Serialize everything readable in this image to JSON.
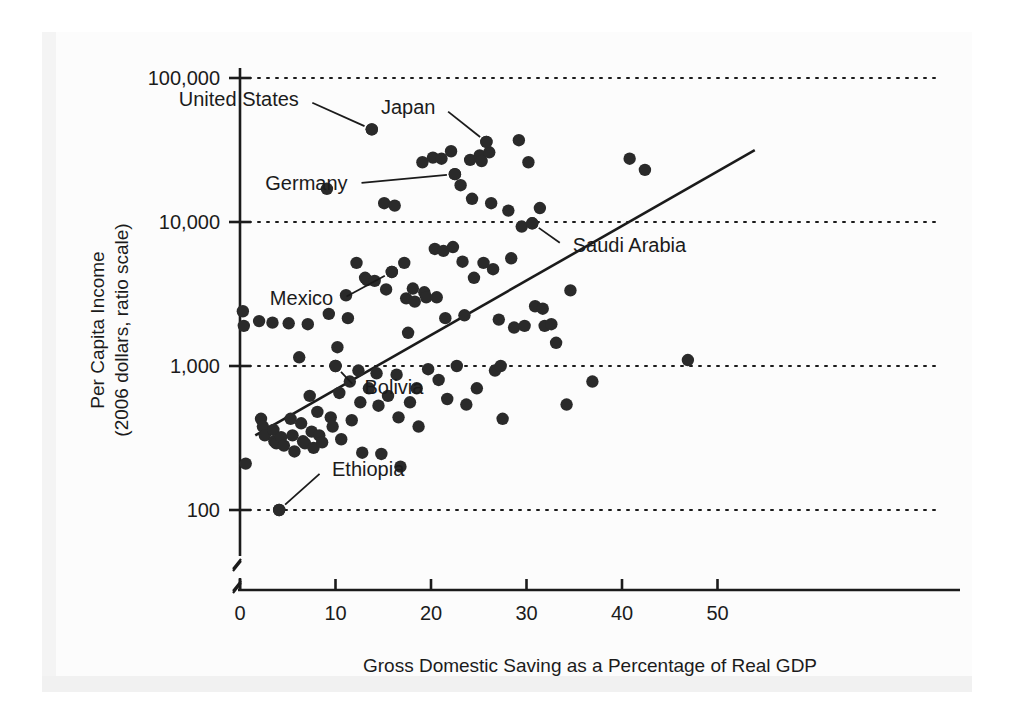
{
  "chart_data": {
    "type": "scatter",
    "title": "",
    "xlabel": "Gross Domestic Saving as a Percentage of Real GDP",
    "ylabel": "Per Capita Income\n(2006 dollars, ratio scale)",
    "ylabel_line1": "Per Capita Income",
    "ylabel_line2": "(2006 dollars, ratio scale)",
    "xlim": [
      0,
      52
    ],
    "ylim": [
      85,
      110000
    ],
    "yscale": "log",
    "xticks": [
      0,
      10,
      20,
      30,
      40,
      50
    ],
    "xticklabels": [
      "0",
      "10",
      "20",
      "30",
      "40",
      "50"
    ],
    "yticks": [
      100,
      1000,
      10000,
      100000
    ],
    "yticklabels": [
      "100",
      "1,000",
      "10,000",
      "100,000"
    ],
    "grid": "horizontal dotted gridlines at each y tick",
    "legend": "none",
    "axis_break": "both axes broken near origin",
    "marker_color": "#2a2a2a",
    "line_color": "#1b1b1b",
    "trendline": {
      "label": "regression line",
      "x_start": 1.6,
      "y_start": 330,
      "x_end": 53.9,
      "y_end": 31500
    },
    "annotations": [
      {
        "label": "United States",
        "x": 13.8,
        "y": 44000,
        "label_x": 7.0,
        "label_y": 70000
      },
      {
        "label": "Japan",
        "x": 25.8,
        "y": 36000,
        "label_x": 21.3,
        "label_y": 62000
      },
      {
        "label": "Germany",
        "x": 22.5,
        "y": 21500,
        "label_x": 12.1,
        "label_y": 18500
      },
      {
        "label": "Saudi Arabia",
        "x": 30.6,
        "y": 9800,
        "label_x": 34.0,
        "label_y": 6800
      },
      {
        "label": "Mexico",
        "x": 15.9,
        "y": 4500,
        "label_x": 10.6,
        "label_y": 2900
      },
      {
        "label": "Bolivia",
        "x": 10.0,
        "y": 1000,
        "label_x": 12.2,
        "label_y": 700
      },
      {
        "label": "Ethiopia",
        "x": 4.1,
        "y": 100,
        "label_x": 8.8,
        "label_y": 190
      }
    ],
    "points": [
      [
        0.3,
        2400
      ],
      [
        0.4,
        1900
      ],
      [
        0.6,
        210
      ],
      [
        2.0,
        2050
      ],
      [
        2.2,
        430
      ],
      [
        2.4,
        380
      ],
      [
        2.6,
        330
      ],
      [
        3.4,
        2000
      ],
      [
        3.5,
        360
      ],
      [
        3.6,
        300
      ],
      [
        3.8,
        290
      ],
      [
        4.1,
        100
      ],
      [
        4.3,
        320
      ],
      [
        4.6,
        280
      ],
      [
        5.1,
        1980
      ],
      [
        5.3,
        430
      ],
      [
        5.5,
        330
      ],
      [
        5.7,
        255
      ],
      [
        6.2,
        1150
      ],
      [
        6.4,
        400
      ],
      [
        6.6,
        300
      ],
      [
        6.8,
        290
      ],
      [
        7.1,
        1950
      ],
      [
        7.3,
        620
      ],
      [
        7.5,
        350
      ],
      [
        7.7,
        270
      ],
      [
        8.1,
        480
      ],
      [
        8.3,
        330
      ],
      [
        8.6,
        295
      ],
      [
        9.1,
        17000
      ],
      [
        9.3,
        2300
      ],
      [
        9.5,
        440
      ],
      [
        9.7,
        380
      ],
      [
        10.0,
        1000
      ],
      [
        10.2,
        1350
      ],
      [
        10.4,
        650
      ],
      [
        10.6,
        310
      ],
      [
        11.1,
        3100
      ],
      [
        11.3,
        2150
      ],
      [
        11.5,
        780
      ],
      [
        11.7,
        420
      ],
      [
        12.2,
        5200
      ],
      [
        12.4,
        930
      ],
      [
        12.6,
        560
      ],
      [
        12.8,
        250
      ],
      [
        13.1,
        4100
      ],
      [
        13.3,
        3950
      ],
      [
        13.5,
        700
      ],
      [
        13.8,
        44000
      ],
      [
        14.1,
        3900
      ],
      [
        14.3,
        890
      ],
      [
        14.5,
        530
      ],
      [
        14.8,
        245
      ],
      [
        15.1,
        13500
      ],
      [
        15.3,
        3400
      ],
      [
        15.5,
        620
      ],
      [
        15.9,
        4500
      ],
      [
        16.2,
        13000
      ],
      [
        16.4,
        870
      ],
      [
        16.6,
        440
      ],
      [
        16.8,
        200
      ],
      [
        17.2,
        5200
      ],
      [
        17.4,
        2950
      ],
      [
        17.6,
        1700
      ],
      [
        17.8,
        560
      ],
      [
        18.1,
        3450
      ],
      [
        18.3,
        2800
      ],
      [
        18.5,
        700
      ],
      [
        18.7,
        380
      ],
      [
        19.1,
        26000
      ],
      [
        19.3,
        3250
      ],
      [
        19.5,
        3000
      ],
      [
        19.7,
        950
      ],
      [
        20.2,
        28000
      ],
      [
        20.4,
        6500
      ],
      [
        20.6,
        3000
      ],
      [
        20.8,
        800
      ],
      [
        21.1,
        27500
      ],
      [
        21.3,
        6300
      ],
      [
        21.5,
        2150
      ],
      [
        21.7,
        590
      ],
      [
        22.1,
        31000
      ],
      [
        22.3,
        6700
      ],
      [
        22.5,
        21500
      ],
      [
        22.7,
        1000
      ],
      [
        23.1,
        18000
      ],
      [
        23.3,
        5300
      ],
      [
        23.5,
        2250
      ],
      [
        23.7,
        540
      ],
      [
        24.1,
        27000
      ],
      [
        24.3,
        14500
      ],
      [
        24.5,
        4100
      ],
      [
        24.8,
        700
      ],
      [
        25.1,
        29000
      ],
      [
        25.3,
        26500
      ],
      [
        25.5,
        5200
      ],
      [
        25.8,
        36000
      ],
      [
        26.1,
        30500
      ],
      [
        26.3,
        13500
      ],
      [
        26.5,
        4700
      ],
      [
        26.7,
        930
      ],
      [
        27.1,
        2100
      ],
      [
        27.3,
        1000
      ],
      [
        27.5,
        430
      ],
      [
        28.1,
        12000
      ],
      [
        28.4,
        5600
      ],
      [
        28.7,
        1850
      ],
      [
        29.2,
        37000
      ],
      [
        29.5,
        9300
      ],
      [
        29.8,
        1900
      ],
      [
        30.2,
        26000
      ],
      [
        30.6,
        9800
      ],
      [
        30.9,
        2600
      ],
      [
        31.4,
        12500
      ],
      [
        31.7,
        2500
      ],
      [
        31.9,
        1900
      ],
      [
        32.6,
        1950
      ],
      [
        33.1,
        1450
      ],
      [
        34.2,
        540
      ],
      [
        34.6,
        3350
      ],
      [
        36.9,
        780
      ],
      [
        40.8,
        27500
      ],
      [
        42.4,
        23000
      ],
      [
        46.9,
        1100
      ]
    ]
  }
}
